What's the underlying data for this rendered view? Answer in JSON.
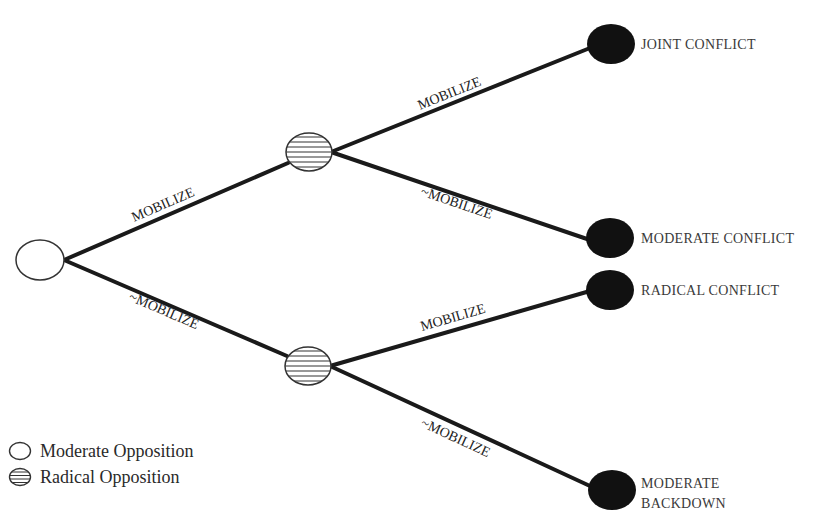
{
  "diagram": {
    "type": "game-tree",
    "nodes": {
      "root": {
        "type": "moderate-opposition",
        "cx": 40,
        "cy": 260
      },
      "upper": {
        "type": "radical-opposition",
        "cx": 309,
        "cy": 152
      },
      "lower": {
        "type": "radical-opposition",
        "cx": 308,
        "cy": 366
      }
    },
    "edges": [
      {
        "from": "root",
        "to": "upper",
        "label": "MOBILIZE"
      },
      {
        "from": "root",
        "to": "lower",
        "label": "~MOBILIZE"
      },
      {
        "from": "upper",
        "to": "joint-conflict",
        "label": "MOBILIZE"
      },
      {
        "from": "upper",
        "to": "moderate-conflict",
        "label": "~MOBILIZE"
      },
      {
        "from": "lower",
        "to": "radical-conflict",
        "label": "MOBILIZE"
      },
      {
        "from": "lower",
        "to": "moderate-backdown",
        "label": "~MOBILIZE"
      }
    ],
    "outcomes": [
      {
        "id": "joint-conflict",
        "label": "JOINT CONFLICT"
      },
      {
        "id": "moderate-conflict",
        "label": "MODERATE CONFLICT"
      },
      {
        "id": "radical-conflict",
        "label": "RADICAL CONFLICT"
      },
      {
        "id": "moderate-backdown",
        "label_line1": "MODERATE",
        "label_line2": "BACKDOWN"
      }
    ]
  },
  "legend": {
    "items": [
      {
        "symbol": "open-circle",
        "label": "Moderate Opposition"
      },
      {
        "symbol": "hatched-circle",
        "label": "Radical Opposition"
      }
    ]
  },
  "colors": {
    "edge": "#1a1a1a",
    "terminal": "#111111",
    "outline": "#333333",
    "background": "#ffffff"
  }
}
